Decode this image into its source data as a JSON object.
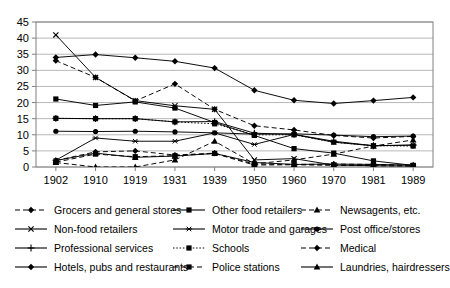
{
  "chart_data": {
    "type": "line",
    "title": "",
    "xlabel": "",
    "ylabel": "",
    "categories": [
      "1902",
      "1910",
      "1919",
      "1931",
      "1939",
      "1950",
      "1960",
      "1970",
      "1981",
      "1989"
    ],
    "ylim": [
      0,
      45
    ],
    "ytick_step": 5,
    "yticks": [
      "0",
      "5",
      "10",
      "15",
      "20",
      "25",
      "30",
      "35",
      "40",
      "45"
    ],
    "grid": true,
    "legend_position": "bottom",
    "series": [
      {
        "name": "Grocers and general stores",
        "marker": "diamond",
        "line": "dashed",
        "values": [
          33.0,
          27.8,
          20.5,
          25.8,
          17.9,
          12.8,
          11.5,
          9.8,
          9.0,
          9.5
        ]
      },
      {
        "name": "Other food retailers",
        "marker": "square",
        "line": "solid",
        "values": [
          21.1,
          19.1,
          20.2,
          18.3,
          13.8,
          9.8,
          5.7,
          4.3,
          1.9,
          0.5
        ]
      },
      {
        "name": "Newsagents, etc.",
        "marker": "triangle",
        "line": "dashed",
        "values": [
          1.4,
          0.0,
          0.0,
          2.2,
          8.0,
          1.0,
          2.2,
          4.0,
          6.5,
          8.4
        ]
      },
      {
        "name": "Non-food retailers",
        "marker": "cross",
        "line": "solid",
        "values": [
          41.0,
          27.8,
          20.6,
          19.0,
          17.9,
          2.2,
          2.6,
          0.6,
          0.4,
          0.3
        ]
      },
      {
        "name": "Motor trade and garages",
        "marker": "asterisk",
        "line": "solid",
        "values": [
          2.1,
          9.0,
          8.0,
          8.0,
          10.6,
          7.0,
          10.1,
          7.7,
          6.6,
          6.8
        ]
      },
      {
        "name": "Post office/stores",
        "marker": "circle",
        "line": "solid",
        "values": [
          11.1,
          11.0,
          11.1,
          10.9,
          10.6,
          10.2,
          10.3,
          9.9,
          9.4,
          9.6
        ]
      },
      {
        "name": "Professional services",
        "marker": "plus",
        "line": "solid",
        "values": [
          15.1,
          15.0,
          15.0,
          14.0,
          14.1,
          10.5,
          10.1,
          8.0,
          6.6,
          6.8
        ]
      },
      {
        "name": "Schools",
        "marker": "square",
        "line": "dotted",
        "values": [
          15.1,
          15.0,
          15.0,
          14.0,
          13.4,
          10.0,
          10.0,
          7.7,
          6.6,
          6.5
        ]
      },
      {
        "name": "Medical",
        "marker": "diamond",
        "line": "dashed",
        "values": [
          2.0,
          4.7,
          5.0,
          3.7,
          4.3,
          0.9,
          0.8,
          0.9,
          0.8,
          0.5
        ]
      },
      {
        "name": "Hotels, pubs and restaurants",
        "marker": "diamond",
        "line": "solid",
        "values": [
          34.0,
          34.9,
          33.9,
          32.8,
          30.7,
          23.8,
          20.7,
          19.7,
          20.6,
          21.6
        ]
      },
      {
        "name": "Police stations",
        "marker": "square",
        "line": "dashed",
        "values": [
          1.5,
          4.0,
          3.2,
          3.5,
          4.2,
          0.6,
          0.7,
          0.5,
          0.4,
          0.3
        ]
      },
      {
        "name": "Laundries, hairdressers",
        "marker": "triangle",
        "line": "solid",
        "values": [
          2.0,
          4.3,
          3.0,
          3.4,
          4.2,
          1.4,
          0.8,
          0.9,
          0.8,
          0.6
        ]
      }
    ]
  },
  "legend": {
    "items": [
      {
        "label": "Grocers and general stores",
        "marker": "diamond",
        "line": "dashed"
      },
      {
        "label": "Other food retailers",
        "marker": "square",
        "line": "solid"
      },
      {
        "label": "Newsagents, etc.",
        "marker": "triangle",
        "line": "dashed"
      },
      {
        "label": "Non-food retailers",
        "marker": "cross",
        "line": "solid"
      },
      {
        "label": "Motor trade and garages",
        "marker": "asterisk",
        "line": "solid"
      },
      {
        "label": "Post office/stores",
        "marker": "circle",
        "line": "solid"
      },
      {
        "label": "Professional services",
        "marker": "plus",
        "line": "solid"
      },
      {
        "label": "Schools",
        "marker": "square",
        "line": "dotted"
      },
      {
        "label": "Medical",
        "marker": "diamond",
        "line": "dashed"
      },
      {
        "label": "Hotels, pubs and restaurants",
        "marker": "diamond",
        "line": "solid"
      },
      {
        "label": "Police stations",
        "marker": "square",
        "line": "dashed"
      },
      {
        "label": "Laundries, hairdressers",
        "marker": "triangle",
        "line": "solid"
      }
    ]
  },
  "colors": {
    "line": "#000000",
    "grid": "#a6a6a6",
    "axis": "#808080",
    "background": "#ffffff"
  }
}
